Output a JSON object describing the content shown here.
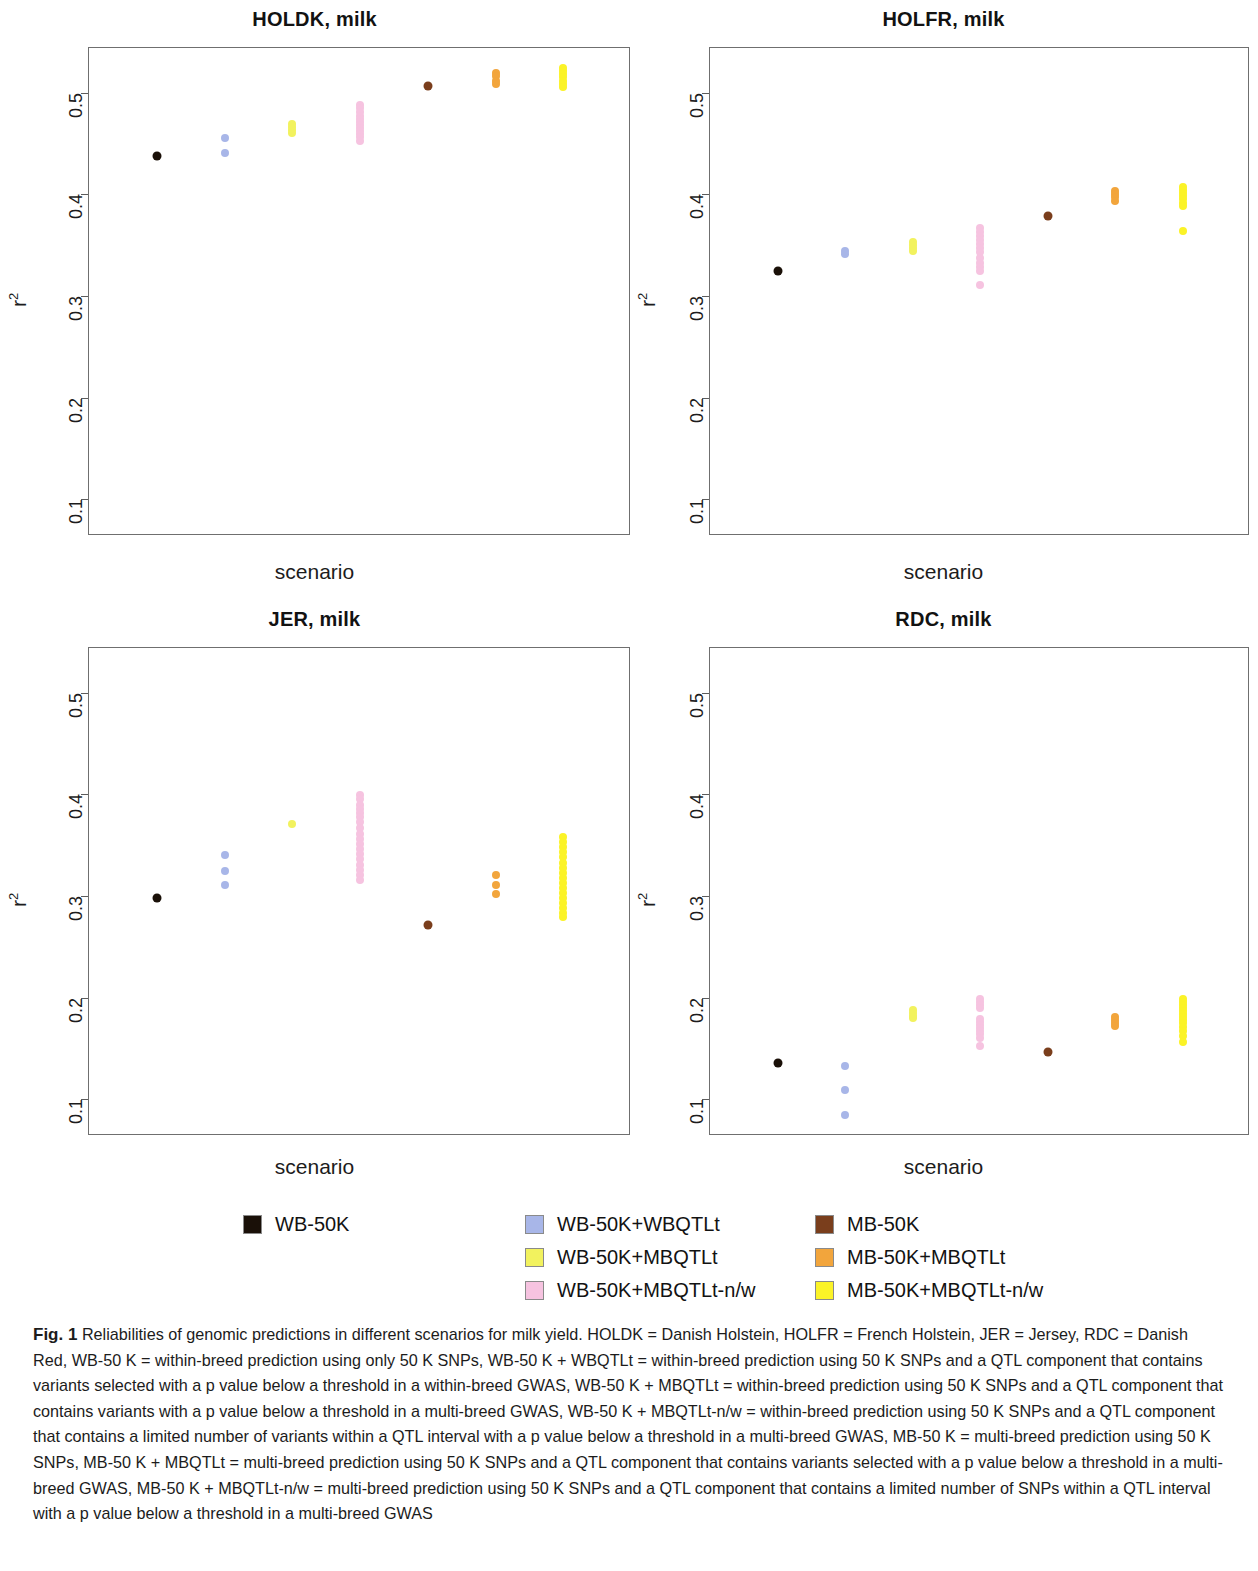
{
  "figure": {
    "xlabel": "scenario",
    "ylabel": "r",
    "ylabel_sup": "2"
  },
  "legend": {
    "columns": [
      {
        "items": [
          {
            "label": "WB-50K",
            "color": "#1a1008"
          }
        ]
      },
      {
        "items": [
          {
            "label": "WB-50K+WBQTLt",
            "color": "#a8b6e8"
          },
          {
            "label": "WB-50K+MBQTLt",
            "color": "#f2f25e"
          },
          {
            "label": "WB-50K+MBQTLt-n/w",
            "color": "#f6c3e0"
          }
        ]
      },
      {
        "items": [
          {
            "label": "MB-50K",
            "color": "#7a3e1c"
          },
          {
            "label": "MB-50K+MBQTLt",
            "color": "#f2a53c"
          },
          {
            "label": "MB-50K+MBQTLt-n/w",
            "color": "#fbf327"
          }
        ]
      }
    ]
  },
  "caption": {
    "prefix": "Fig. 1",
    "text": "Reliabilities of genomic predictions in different scenarios for milk yield. HOLDK = Danish Holstein, HOLFR = French Holstein, JER = Jersey, RDC = Danish Red, WB-50 K = within-breed prediction using only 50 K SNPs, WB-50 K + WBQTLt = within-breed prediction using 50 K SNPs and a QTL component that contains variants selected with a p value below a threshold in a within-breed GWAS, WB-50 K + MBQTLt = within-breed prediction using 50 K SNPs and a QTL component that contains variants with a p value below a threshold in a multi-breed GWAS, WB-50 K + MBQTLt-n/w = within-breed prediction using 50 K SNPs and a QTL component that contains a limited number of variants within a QTL interval with a p value below a threshold in a multi-breed GWAS, MB-50 K = multi-breed prediction using 50 K SNPs, MB-50 K + MBQTLt = multi-breed prediction using 50 K SNPs and a QTL component that contains variants selected with a p value below a threshold in a multi-breed GWAS, MB-50 K + MBQTLt-n/w = multi-breed prediction using 50 K SNPs and a QTL component that contains a limited number of SNPs within a QTL interval with a p value below a threshold in a multi-breed GWAS"
  },
  "chart_data": [
    {
      "type": "scatter",
      "title": "HOLDK, milk",
      "xlabel": "scenario",
      "ylabel": "r2",
      "ylim": [
        0.065,
        0.545
      ],
      "yticks": [
        0.1,
        0.2,
        0.3,
        0.4,
        0.5
      ],
      "grid": false,
      "xcategories": [
        "WB-50K",
        "WB-50K+WBQTLt",
        "WB-50K+MBQTLt",
        "WB-50K+MBQTLt-n/w",
        "MB-50K",
        "MB-50K+MBQTLt",
        "MB-50K+MBQTLt-n/w"
      ],
      "series": [
        {
          "name": "WB-50K",
          "color": "#1a1008",
          "x": 1,
          "values": [
            0.439
          ]
        },
        {
          "name": "WB-50K+WBQTLt",
          "color": "#a8b6e8",
          "x": 2,
          "values": [
            0.456,
            0.442
          ]
        },
        {
          "name": "WB-50K+MBQTLt",
          "color": "#f2f25e",
          "x": 3,
          "values": [
            0.47,
            0.467,
            0.464,
            0.461
          ]
        },
        {
          "name": "WB-50K+MBQTLt-n/w",
          "color": "#f6c3e0",
          "x": 4,
          "values": [
            0.489,
            0.486,
            0.482,
            0.478,
            0.475,
            0.472,
            0.469,
            0.466,
            0.463,
            0.46,
            0.457,
            0.454
          ]
        },
        {
          "name": "MB-50K",
          "color": "#7a3e1c",
          "x": 5,
          "values": [
            0.508
          ]
        },
        {
          "name": "MB-50K+MBQTLt",
          "color": "#f2a53c",
          "x": 6,
          "values": [
            0.52,
            0.517,
            0.513,
            0.51
          ]
        },
        {
          "name": "MB-50K+MBQTLt-n/w",
          "color": "#fbf327",
          "x": 7,
          "values": [
            0.525,
            0.522,
            0.519,
            0.516,
            0.513,
            0.51,
            0.507
          ]
        }
      ]
    },
    {
      "type": "scatter",
      "title": "HOLFR, milk",
      "xlabel": "scenario",
      "ylabel": "r2",
      "ylim": [
        0.065,
        0.545
      ],
      "yticks": [
        0.1,
        0.2,
        0.3,
        0.4,
        0.5
      ],
      "grid": false,
      "xcategories": [
        "WB-50K",
        "WB-50K+WBQTLt",
        "WB-50K+MBQTLt",
        "WB-50K+MBQTLt-n/w",
        "MB-50K",
        "MB-50K+MBQTLt",
        "MB-50K+MBQTLt-n/w"
      ],
      "series": [
        {
          "name": "WB-50K",
          "color": "#1a1008",
          "x": 1,
          "values": [
            0.326
          ]
        },
        {
          "name": "WB-50K+WBQTLt",
          "color": "#a8b6e8",
          "x": 2,
          "values": [
            0.345,
            0.342
          ]
        },
        {
          "name": "WB-50K+MBQTLt",
          "color": "#f2f25e",
          "x": 3,
          "values": [
            0.354,
            0.351,
            0.348,
            0.345
          ]
        },
        {
          "name": "WB-50K+MBQTLt-n/w",
          "color": "#f6c3e0",
          "x": 4,
          "values": [
            0.368,
            0.364,
            0.36,
            0.356,
            0.352,
            0.348,
            0.344,
            0.338,
            0.334,
            0.33,
            0.326,
            0.312
          ]
        },
        {
          "name": "MB-50K",
          "color": "#7a3e1c",
          "x": 5,
          "values": [
            0.38
          ]
        },
        {
          "name": "MB-50K+MBQTLt",
          "color": "#f2a53c",
          "x": 6,
          "values": [
            0.404,
            0.401,
            0.398,
            0.395
          ]
        },
        {
          "name": "MB-50K+MBQTLt-n/w",
          "color": "#fbf327",
          "x": 7,
          "values": [
            0.408,
            0.405,
            0.402,
            0.399,
            0.396,
            0.393,
            0.39,
            0.365
          ]
        }
      ]
    },
    {
      "type": "scatter",
      "title": "JER, milk",
      "xlabel": "scenario",
      "ylabel": "r2",
      "ylim": [
        0.065,
        0.545
      ],
      "yticks": [
        0.1,
        0.2,
        0.3,
        0.4,
        0.5
      ],
      "grid": false,
      "xcategories": [
        "WB-50K",
        "WB-50K+WBQTLt",
        "WB-50K+MBQTLt",
        "WB-50K+MBQTLt-n/w",
        "MB-50K",
        "MB-50K+MBQTLt",
        "MB-50K+MBQTLt-n/w"
      ],
      "series": [
        {
          "name": "WB-50K",
          "color": "#1a1008",
          "x": 1,
          "values": [
            0.299
          ]
        },
        {
          "name": "WB-50K+WBQTLt",
          "color": "#a8b6e8",
          "x": 2,
          "values": [
            0.341,
            0.326,
            0.312
          ]
        },
        {
          "name": "WB-50K+MBQTLt",
          "color": "#f2f25e",
          "x": 3,
          "values": [
            0.372
          ]
        },
        {
          "name": "WB-50K+MBQTLt-n/w",
          "color": "#f6c3e0",
          "x": 4,
          "values": [
            0.4,
            0.396,
            0.391,
            0.387,
            0.383,
            0.379,
            0.374,
            0.368,
            0.362,
            0.357,
            0.352,
            0.347,
            0.342,
            0.337,
            0.332,
            0.327,
            0.322,
            0.317
          ]
        },
        {
          "name": "MB-50K",
          "color": "#7a3e1c",
          "x": 5,
          "values": [
            0.273
          ]
        },
        {
          "name": "MB-50K+MBQTLt",
          "color": "#f2a53c",
          "x": 6,
          "values": [
            0.322,
            0.312,
            0.303
          ]
        },
        {
          "name": "MB-50K+MBQTLt-n/w",
          "color": "#fbf327",
          "x": 7,
          "values": [
            0.359,
            0.354,
            0.349,
            0.344,
            0.339,
            0.334,
            0.329,
            0.324,
            0.319,
            0.314,
            0.309,
            0.304,
            0.299,
            0.294,
            0.289,
            0.284,
            0.28
          ]
        }
      ]
    },
    {
      "type": "scatter",
      "title": "RDC, milk",
      "xlabel": "scenario",
      "ylabel": "r2",
      "ylim": [
        0.065,
        0.545
      ],
      "yticks": [
        0.1,
        0.2,
        0.3,
        0.4,
        0.5
      ],
      "grid": false,
      "xcategories": [
        "WB-50K",
        "WB-50K+WBQTLt",
        "WB-50K+MBQTLt",
        "WB-50K+MBQTLt-n/w",
        "MB-50K",
        "MB-50K+MBQTLt",
        "MB-50K+MBQTLt-n/w"
      ],
      "series": [
        {
          "name": "WB-50K",
          "color": "#1a1008",
          "x": 1,
          "values": [
            0.137
          ]
        },
        {
          "name": "WB-50K+WBQTLt",
          "color": "#a8b6e8",
          "x": 2,
          "values": [
            0.134,
            0.11,
            0.086
          ]
        },
        {
          "name": "WB-50K+MBQTLt",
          "color": "#f2f25e",
          "x": 3,
          "values": [
            0.189,
            0.186,
            0.183,
            0.181
          ]
        },
        {
          "name": "WB-50K+MBQTLt-n/w",
          "color": "#f6c3e0",
          "x": 4,
          "values": [
            0.2,
            0.197,
            0.194,
            0.191,
            0.18,
            0.177,
            0.174,
            0.171,
            0.168,
            0.165,
            0.161,
            0.154
          ]
        },
        {
          "name": "MB-50K",
          "color": "#7a3e1c",
          "x": 5,
          "values": [
            0.148
          ]
        },
        {
          "name": "MB-50K+MBQTLt",
          "color": "#f2a53c",
          "x": 6,
          "values": [
            0.182,
            0.179,
            0.176,
            0.173
          ]
        },
        {
          "name": "MB-50K+MBQTLt-n/w",
          "color": "#fbf327",
          "x": 7,
          "values": [
            0.2,
            0.197,
            0.194,
            0.191,
            0.188,
            0.185,
            0.182,
            0.179,
            0.176,
            0.172,
            0.168,
            0.163,
            0.157
          ]
        }
      ]
    }
  ]
}
